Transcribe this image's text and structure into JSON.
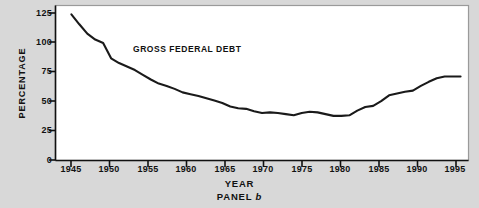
{
  "figure": {
    "panel_caption_prefix": "PANEL",
    "panel_caption_letter": "b",
    "series_label": "GROSS FEDERAL DEBT",
    "line_color": "#1a1a1a",
    "plot_background": "#ffffff",
    "page_background": "#d8d8d8"
  },
  "chart_data": {
    "type": "line",
    "title": "",
    "subtitle": "",
    "xlabel": "YEAR",
    "ylabel": "PERCENTAGE",
    "annotations": [
      "GROSS FEDERAL DEBT",
      "PANEL b"
    ],
    "legend_position": "inline-label",
    "grid": false,
    "xlim": [
      1944,
      1996
    ],
    "ylim": [
      0,
      132
    ],
    "yticks": [
      0,
      25,
      50,
      75,
      100,
      125
    ],
    "ytick_labels": [
      "0",
      "25",
      "50",
      "75",
      "100",
      "125"
    ],
    "xticks": [
      1945,
      1950,
      1955,
      1960,
      1965,
      1970,
      1975,
      1980,
      1985,
      1990,
      1995
    ],
    "xtick_labels": [
      "1945",
      "1950",
      "1955",
      "1960",
      "1965",
      "1970",
      "1975",
      "1980",
      "1985",
      "1990",
      "1995"
    ],
    "series": [
      {
        "name": "GROSS FEDERAL DEBT",
        "x": [
          1946,
          1947,
          1948,
          1949,
          1950,
          1951,
          1952,
          1953,
          1954,
          1955,
          1956,
          1957,
          1958,
          1959,
          1960,
          1961,
          1962,
          1963,
          1964,
          1965,
          1966,
          1967,
          1968,
          1969,
          1970,
          1971,
          1972,
          1973,
          1974,
          1975,
          1976,
          1977,
          1978,
          1979,
          1980,
          1981,
          1982,
          1983,
          1984,
          1985,
          1986,
          1987,
          1988,
          1989,
          1990,
          1991,
          1992,
          1993,
          1994,
          1995
        ],
        "values": [
          124.5,
          116.0,
          108.0,
          103.0,
          100.0,
          87.0,
          83.0,
          80.0,
          77.0,
          73.0,
          69.0,
          65.5,
          63.5,
          61.0,
          58.0,
          56.5,
          55.0,
          53.0,
          51.0,
          49.0,
          46.0,
          44.5,
          44.0,
          42.0,
          40.5,
          41.0,
          40.5,
          39.5,
          38.5,
          40.5,
          41.5,
          41.0,
          39.5,
          38.0,
          38.0,
          38.5,
          42.5,
          45.5,
          46.5,
          50.5,
          55.5,
          57.0,
          58.5,
          59.5,
          63.5,
          67.0,
          70.0,
          71.5,
          71.5,
          71.5
        ]
      }
    ],
    "units": "percent of GDP"
  },
  "axis": {
    "y_title": "PERCENTAGE",
    "x_title": "YEAR"
  }
}
